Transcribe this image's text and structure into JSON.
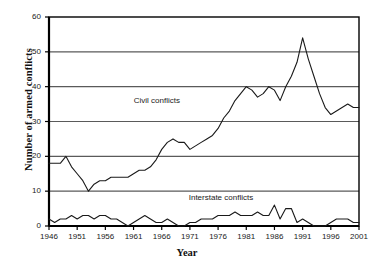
{
  "chart_data": {
    "type": "line",
    "title": "",
    "xlabel": "Year",
    "ylabel": "Number of armed conflicts",
    "xlim": [
      1946,
      2001
    ],
    "ylim": [
      0,
      60
    ],
    "xticks": [
      1946,
      1951,
      1956,
      1961,
      1966,
      1971,
      1976,
      1981,
      1986,
      1991,
      1996,
      2001
    ],
    "yticks": [
      0,
      10,
      20,
      30,
      40,
      50,
      60
    ],
    "grid": "horizontal",
    "legend_position": "inline-annotations",
    "x": [
      1946,
      1947,
      1948,
      1949,
      1950,
      1951,
      1952,
      1953,
      1954,
      1955,
      1956,
      1957,
      1958,
      1959,
      1960,
      1961,
      1962,
      1963,
      1964,
      1965,
      1966,
      1967,
      1968,
      1969,
      1970,
      1971,
      1972,
      1973,
      1974,
      1975,
      1976,
      1977,
      1978,
      1979,
      1980,
      1981,
      1982,
      1983,
      1984,
      1985,
      1986,
      1987,
      1988,
      1989,
      1990,
      1991,
      1992,
      1993,
      1994,
      1995,
      1996,
      1997,
      1998,
      1999,
      2000,
      2001
    ],
    "series": [
      {
        "name": "Civil conflicts",
        "label": "Civil conflicts",
        "color": "#1a1a1a",
        "label_x": 1966,
        "label_y": 36,
        "values": [
          18,
          18,
          18,
          20,
          17,
          15,
          13,
          10,
          12,
          13,
          13,
          14,
          14,
          14,
          14,
          15,
          16,
          16,
          17,
          19,
          22,
          24,
          25,
          24,
          24,
          22,
          23,
          24,
          25,
          26,
          28,
          31,
          33,
          36,
          38,
          40,
          39,
          37,
          38,
          40,
          39,
          36,
          40,
          43,
          47,
          54,
          48,
          43,
          38,
          34,
          32,
          33,
          34,
          35,
          34,
          34
        ]
      },
      {
        "name": "Interstate conflicts",
        "label": "Interstate conflicts",
        "color": "#1a1a1a",
        "label_x": 1977,
        "label_y": 8,
        "values": [
          2,
          1,
          2,
          2,
          3,
          2,
          3,
          3,
          2,
          3,
          3,
          2,
          2,
          1,
          0,
          1,
          2,
          3,
          2,
          1,
          1,
          2,
          1,
          0,
          0,
          1,
          1,
          2,
          2,
          2,
          3,
          3,
          3,
          4,
          3,
          3,
          3,
          4,
          3,
          3,
          6,
          2,
          5,
          5,
          1,
          2,
          1,
          0,
          0,
          0,
          1,
          2,
          2,
          2,
          1,
          1
        ]
      }
    ]
  },
  "axis": {
    "y_tick_labels": [
      "0",
      "10",
      "20",
      "30",
      "40",
      "50",
      "60"
    ],
    "x_tick_labels": [
      "1946",
      "1951",
      "1956",
      "1961",
      "1966",
      "1971",
      "1976",
      "1981",
      "1986",
      "1991",
      "1996",
      "2001"
    ]
  },
  "colors": {
    "line": "#1a1a1a",
    "grid": "#5a5a5a",
    "axis": "#000000",
    "background": "#ffffff"
  }
}
